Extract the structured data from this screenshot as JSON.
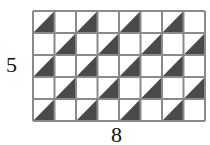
{
  "figure": {
    "rows": 5,
    "cols": 8,
    "row_label": "5",
    "col_label": "8",
    "cell_width": 21.5,
    "cell_height": 22,
    "shaded_cells": [
      [
        0,
        0
      ],
      [
        0,
        2
      ],
      [
        0,
        4
      ],
      [
        0,
        6
      ],
      [
        1,
        1
      ],
      [
        1,
        3
      ],
      [
        1,
        5
      ],
      [
        1,
        7
      ],
      [
        2,
        0
      ],
      [
        2,
        2
      ],
      [
        2,
        4
      ],
      [
        2,
        6
      ],
      [
        3,
        1
      ],
      [
        3,
        3
      ],
      [
        3,
        5
      ],
      [
        3,
        7
      ],
      [
        4,
        0
      ],
      [
        4,
        2
      ],
      [
        4,
        4
      ],
      [
        4,
        6
      ]
    ],
    "shading": "lower-right triangle (diagonal from bottom-left to top-right)",
    "colors": {
      "shade": "#4a4a4a",
      "grid_line": "#8a8a8a",
      "background": "#ffffff"
    }
  }
}
